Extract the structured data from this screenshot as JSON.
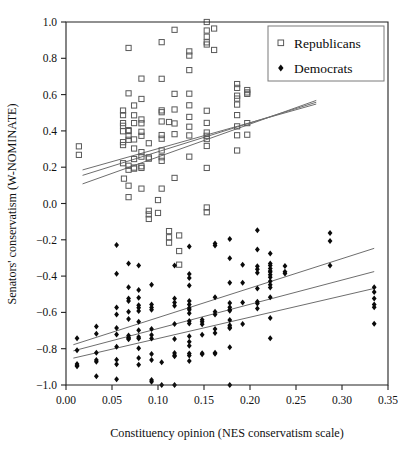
{
  "chart_data": {
    "type": "scatter",
    "title": "",
    "xlabel": "Constituency opinion (NES conservatism scale)",
    "ylabel": "Senators' conservatism (W-NOMINATE)",
    "xlim": [
      0.0,
      0.35
    ],
    "ylim": [
      -1.0,
      1.0
    ],
    "xticks": [
      "0.00",
      "0.05",
      "0.10",
      "0.15",
      "0.20",
      "0.25",
      "0.30",
      "0.35"
    ],
    "xtick_values": [
      0.0,
      0.05,
      0.1,
      0.15,
      0.2,
      0.25,
      0.3,
      0.35
    ],
    "yticks": [
      "1.0",
      "0.8",
      "0.6",
      "0.4",
      "0.2",
      "0.0",
      "−0.2",
      "−0.4",
      "−0.6",
      "−0.8",
      "−1.0"
    ],
    "ytick_values": [
      1.0,
      0.8,
      0.6,
      0.4,
      0.2,
      0.0,
      -0.2,
      -0.4,
      -0.6,
      -0.8,
      -1.0
    ],
    "grid": false,
    "legend_position": "top-right",
    "legend": [
      {
        "name": "Republicans",
        "marker": "open-square",
        "color": "#595959"
      },
      {
        "name": "Democrats",
        "marker": "filled-diamond",
        "color": "#0a0a0a"
      }
    ],
    "series": [
      {
        "name": "Republicans",
        "marker": "open-square",
        "color": "#595959",
        "points": [
          [
            0.014,
            0.315
          ],
          [
            0.014,
            0.268
          ],
          [
            0.062,
            0.512
          ],
          [
            0.062,
            0.487
          ],
          [
            0.062,
            0.443
          ],
          [
            0.062,
            0.428
          ],
          [
            0.062,
            0.398
          ],
          [
            0.062,
            0.338
          ],
          [
            0.062,
            0.322
          ],
          [
            0.062,
            0.222
          ],
          [
            0.063,
            0.137
          ],
          [
            0.068,
            0.857
          ],
          [
            0.068,
            0.607
          ],
          [
            0.068,
            0.404
          ],
          [
            0.068,
            0.399
          ],
          [
            0.068,
            0.372
          ],
          [
            0.068,
            0.351
          ],
          [
            0.068,
            0.208
          ],
          [
            0.068,
            0.186
          ],
          [
            0.068,
            0.098
          ],
          [
            0.068,
            0.035
          ],
          [
            0.074,
            0.54
          ],
          [
            0.074,
            0.486
          ],
          [
            0.074,
            0.443
          ],
          [
            0.074,
            0.353
          ],
          [
            0.074,
            0.303
          ],
          [
            0.074,
            0.245
          ],
          [
            0.074,
            0.198
          ],
          [
            0.074,
            0.192
          ],
          [
            0.082,
            0.688
          ],
          [
            0.082,
            0.576
          ],
          [
            0.082,
            0.463
          ],
          [
            0.082,
            0.442
          ],
          [
            0.082,
            0.395
          ],
          [
            0.082,
            0.373
          ],
          [
            0.082,
            0.283
          ],
          [
            0.082,
            0.258
          ],
          [
            0.082,
            0.205
          ],
          [
            0.082,
            0.196
          ],
          [
            0.082,
            0.082
          ],
          [
            0.09,
            0.332
          ],
          [
            0.09,
            0.254
          ],
          [
            0.09,
            0.247
          ],
          [
            0.09,
            -0.04
          ],
          [
            0.09,
            -0.06
          ],
          [
            0.09,
            -0.085
          ],
          [
            0.1,
            0.019
          ],
          [
            0.1,
            -0.052
          ],
          [
            0.104,
            0.889
          ],
          [
            0.104,
            0.687
          ],
          [
            0.104,
            0.513
          ],
          [
            0.104,
            0.503
          ],
          [
            0.104,
            0.452
          ],
          [
            0.104,
            0.377
          ],
          [
            0.104,
            0.357
          ],
          [
            0.104,
            0.292
          ],
          [
            0.104,
            0.255
          ],
          [
            0.104,
            0.235
          ],
          [
            0.104,
            0.082
          ],
          [
            0.112,
            0.449
          ],
          [
            0.112,
            -0.152
          ],
          [
            0.112,
            -0.186
          ],
          [
            0.112,
            -0.216
          ],
          [
            0.118,
            0.957
          ],
          [
            0.118,
            0.604
          ],
          [
            0.118,
            0.518
          ],
          [
            0.118,
            0.441
          ],
          [
            0.118,
            0.382
          ],
          [
            0.118,
            0.141
          ],
          [
            0.123,
            -0.176
          ],
          [
            0.123,
            -0.262
          ],
          [
            0.123,
            -0.337
          ],
          [
            0.134,
            0.838
          ],
          [
            0.134,
            0.815
          ],
          [
            0.134,
            0.735
          ],
          [
            0.134,
            0.605
          ],
          [
            0.134,
            0.541
          ],
          [
            0.134,
            0.477
          ],
          [
            0.134,
            0.423
          ],
          [
            0.134,
            0.375
          ],
          [
            0.134,
            0.258
          ],
          [
            0.153,
            1.0
          ],
          [
            0.153,
            0.953
          ],
          [
            0.153,
            0.919
          ],
          [
            0.153,
            0.888
          ],
          [
            0.153,
            0.876
          ],
          [
            0.153,
            0.511
          ],
          [
            0.153,
            0.444
          ],
          [
            0.153,
            0.391
          ],
          [
            0.153,
            0.373
          ],
          [
            0.153,
            0.355
          ],
          [
            0.153,
            0.317
          ],
          [
            0.153,
            0.196
          ],
          [
            0.153,
            -0.022
          ],
          [
            0.153,
            -0.048
          ],
          [
            0.161,
            0.964
          ],
          [
            0.161,
            0.846
          ],
          [
            0.186,
            0.658
          ],
          [
            0.186,
            0.637
          ],
          [
            0.186,
            0.594
          ],
          [
            0.186,
            0.578
          ],
          [
            0.186,
            0.545
          ],
          [
            0.186,
            0.487
          ],
          [
            0.186,
            0.425
          ],
          [
            0.186,
            0.376
          ],
          [
            0.186,
            0.292
          ],
          [
            0.197,
            0.625
          ],
          [
            0.197,
            0.612
          ],
          [
            0.197,
            0.604
          ],
          [
            0.197,
            0.443
          ],
          [
            0.197,
            0.379
          ]
        ],
        "fit_line": {
          "x": [
            0.018,
            0.272
          ],
          "y": [
            0.155,
            0.558
          ]
        },
        "confidence_bands": [
          {
            "x": [
              0.018,
              0.272
            ],
            "y": [
              0.185,
              0.548
            ]
          },
          {
            "x": [
              0.018,
              0.272
            ],
            "y": [
              0.108,
              0.568
            ]
          }
        ]
      },
      {
        "name": "Democrats",
        "marker": "filled-diamond",
        "color": "#0a0a0a",
        "points": [
          [
            0.012,
            -0.742
          ],
          [
            0.012,
            -0.808
          ],
          [
            0.012,
            -0.884
          ],
          [
            0.012,
            -0.893
          ],
          [
            0.012,
            -0.897
          ],
          [
            0.033,
            -0.678
          ],
          [
            0.033,
            -0.718
          ],
          [
            0.033,
            -0.822
          ],
          [
            0.033,
            -0.862
          ],
          [
            0.033,
            -0.872
          ],
          [
            0.033,
            -0.952
          ],
          [
            0.055,
            -0.229
          ],
          [
            0.055,
            -0.387
          ],
          [
            0.055,
            -0.573
          ],
          [
            0.055,
            -0.611
          ],
          [
            0.055,
            -0.686
          ],
          [
            0.055,
            -0.722
          ],
          [
            0.055,
            -0.789
          ],
          [
            0.055,
            -0.861
          ],
          [
            0.055,
            -0.886
          ],
          [
            0.055,
            -0.968
          ],
          [
            0.068,
            -0.331
          ],
          [
            0.068,
            -0.462
          ],
          [
            0.068,
            -0.524
          ],
          [
            0.068,
            -0.537
          ],
          [
            0.068,
            -0.596
          ],
          [
            0.068,
            -0.636
          ],
          [
            0.068,
            -0.727
          ],
          [
            0.068,
            -0.738
          ],
          [
            0.068,
            -0.742
          ],
          [
            0.068,
            -0.748
          ],
          [
            0.079,
            -0.341
          ],
          [
            0.079,
            -0.476
          ],
          [
            0.079,
            -0.519
          ],
          [
            0.079,
            -0.561
          ],
          [
            0.079,
            -0.574
          ],
          [
            0.079,
            -0.592
          ],
          [
            0.079,
            -0.652
          ],
          [
            0.079,
            -0.699
          ],
          [
            0.079,
            -0.736
          ],
          [
            0.079,
            -0.744
          ],
          [
            0.079,
            -0.798
          ],
          [
            0.079,
            -0.851
          ],
          [
            0.079,
            -0.888
          ],
          [
            0.093,
            -0.448
          ],
          [
            0.093,
            -0.556
          ],
          [
            0.093,
            -0.573
          ],
          [
            0.093,
            -0.585
          ],
          [
            0.093,
            -0.691
          ],
          [
            0.093,
            -0.724
          ],
          [
            0.093,
            -0.744
          ],
          [
            0.093,
            -0.829
          ],
          [
            0.093,
            -0.862
          ],
          [
            0.093,
            -0.972
          ],
          [
            0.093,
            -0.982
          ],
          [
            0.104,
            -0.874
          ],
          [
            0.104,
            -1.0
          ],
          [
            0.118,
            -0.341
          ],
          [
            0.118,
            -0.523
          ],
          [
            0.118,
            -0.545
          ],
          [
            0.118,
            -0.563
          ],
          [
            0.118,
            -0.664
          ],
          [
            0.118,
            -0.747
          ],
          [
            0.118,
            -0.824
          ],
          [
            0.118,
            -0.836
          ],
          [
            0.118,
            -0.841
          ],
          [
            0.118,
            -1.0
          ],
          [
            0.134,
            -0.237
          ],
          [
            0.134,
            -0.388
          ],
          [
            0.134,
            -0.411
          ],
          [
            0.134,
            -0.452
          ],
          [
            0.134,
            -0.537
          ],
          [
            0.134,
            -0.556
          ],
          [
            0.134,
            -0.576
          ],
          [
            0.134,
            -0.586
          ],
          [
            0.134,
            -0.604
          ],
          [
            0.134,
            -0.647
          ],
          [
            0.134,
            -0.661
          ],
          [
            0.134,
            -0.731
          ],
          [
            0.134,
            -0.762
          ],
          [
            0.134,
            -0.784
          ],
          [
            0.134,
            -0.826
          ],
          [
            0.134,
            -0.838
          ],
          [
            0.134,
            -0.868
          ],
          [
            0.148,
            -0.641
          ],
          [
            0.148,
            -0.652
          ],
          [
            0.148,
            -0.665
          ],
          [
            0.148,
            -0.723
          ],
          [
            0.148,
            -0.825
          ],
          [
            0.148,
            -0.831
          ],
          [
            0.162,
            -0.221
          ],
          [
            0.162,
            -0.232
          ],
          [
            0.162,
            -0.516
          ],
          [
            0.162,
            -0.596
          ],
          [
            0.162,
            -0.612
          ],
          [
            0.162,
            -0.692
          ],
          [
            0.162,
            -0.713
          ],
          [
            0.162,
            -0.822
          ],
          [
            0.162,
            -0.828
          ],
          [
            0.178,
            -0.195
          ],
          [
            0.178,
            -0.301
          ],
          [
            0.178,
            -0.436
          ],
          [
            0.178,
            -0.548
          ],
          [
            0.178,
            -0.571
          ],
          [
            0.178,
            -0.586
          ],
          [
            0.178,
            -0.591
          ],
          [
            0.178,
            -0.642
          ],
          [
            0.178,
            -0.671
          ],
          [
            0.178,
            -0.682
          ],
          [
            0.178,
            -0.688
          ],
          [
            0.178,
            -0.792
          ],
          [
            0.178,
            -1.0
          ],
          [
            0.192,
            -0.338
          ],
          [
            0.192,
            -0.436
          ],
          [
            0.192,
            -0.546
          ],
          [
            0.192,
            -0.664
          ],
          [
            0.208,
            -0.147
          ],
          [
            0.208,
            -0.254
          ],
          [
            0.208,
            -0.346
          ],
          [
            0.208,
            -0.362
          ],
          [
            0.208,
            -0.382
          ],
          [
            0.208,
            -0.468
          ],
          [
            0.208,
            -0.542
          ],
          [
            0.208,
            -0.551
          ],
          [
            0.208,
            -0.578
          ],
          [
            0.222,
            -0.276
          ],
          [
            0.222,
            -0.331
          ],
          [
            0.222,
            -0.341
          ],
          [
            0.222,
            -0.358
          ],
          [
            0.222,
            -0.372
          ],
          [
            0.222,
            -0.378
          ],
          [
            0.222,
            -0.392
          ],
          [
            0.222,
            -0.406
          ],
          [
            0.222,
            -0.428
          ],
          [
            0.222,
            -0.447
          ],
          [
            0.222,
            -0.463
          ],
          [
            0.222,
            -0.516
          ],
          [
            0.222,
            -0.631
          ],
          [
            0.222,
            -0.742
          ],
          [
            0.238,
            -0.345
          ],
          [
            0.238,
            -0.376
          ],
          [
            0.238,
            -0.386
          ],
          [
            0.287,
            -0.162
          ],
          [
            0.287,
            -0.206
          ],
          [
            0.287,
            -0.341
          ],
          [
            0.335,
            -0.462
          ],
          [
            0.335,
            -0.487
          ],
          [
            0.335,
            -0.523
          ],
          [
            0.335,
            -0.556
          ],
          [
            0.335,
            -0.572
          ],
          [
            0.335,
            -0.662
          ]
        ],
        "fit_line": {
          "x": [
            0.008,
            0.335
          ],
          "y": [
            -0.812,
            -0.375
          ]
        },
        "confidence_bands": [
          {
            "x": [
              0.008,
              0.335
            ],
            "y": [
              -0.778,
              -0.247
            ]
          },
          {
            "x": [
              0.008,
              0.335
            ],
            "y": [
              -0.852,
              -0.468
            ]
          }
        ]
      }
    ]
  },
  "axis": {
    "x_title": "Constituency opinion (NES conservatism scale)",
    "y_title": "Senators' conservatism (W-NOMINATE)"
  },
  "legend": {
    "republicans_label": "Republicans",
    "democrats_label": "Democrats"
  }
}
